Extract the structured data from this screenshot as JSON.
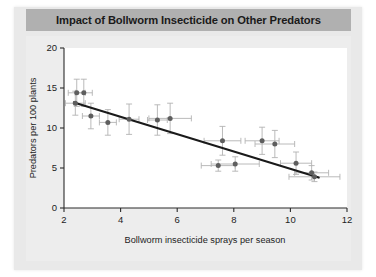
{
  "figure": {
    "title": "Impact of Bollworm Insecticide on Other Predators",
    "title_bg": "#b0b0b0",
    "panel_bg": "#e9e9e9",
    "plot_bg": "#ffffff"
  },
  "chart_data": {
    "type": "scatter",
    "title": "Impact of Bollworm Insecticide on Other Predators",
    "xlabel": "Bollworm insecticide sprays per season",
    "ylabel": "Predators per 100 plants",
    "xlim": [
      2,
      12
    ],
    "ylim": [
      0,
      20
    ],
    "xticks": [
      2,
      4,
      6,
      8,
      10,
      12
    ],
    "yticks": [
      0,
      5,
      10,
      15,
      20
    ],
    "xtick_labels": [
      "2",
      "4",
      "6",
      "8",
      "10",
      "12"
    ],
    "ytick_labels": [
      "0",
      "5",
      "10",
      "15",
      "20"
    ],
    "grid": false,
    "legend": null,
    "point_color": "#5e5e5e",
    "errorbar_color": "#b2b2b2",
    "trendline_color": "#1a1a1a",
    "points": [
      {
        "x": 2.45,
        "y": 14.4,
        "xerr": 0.3,
        "yerr": 1.7
      },
      {
        "x": 2.7,
        "y": 14.4,
        "xerr": 0.3,
        "yerr": 1.7
      },
      {
        "x": 2.4,
        "y": 13.1,
        "xerr": 0.35,
        "yerr": 1.5
      },
      {
        "x": 2.95,
        "y": 11.5,
        "xerr": 0.3,
        "yerr": 1.6
      },
      {
        "x": 3.55,
        "y": 10.7,
        "xerr": 0.3,
        "yerr": 1.6
      },
      {
        "x": 4.3,
        "y": 11.1,
        "xerr": 0.35,
        "yerr": 1.9
      },
      {
        "x": 5.3,
        "y": 11.0,
        "xerr": 0.35,
        "yerr": 1.9
      },
      {
        "x": 5.75,
        "y": 11.2,
        "xerr": 0.75,
        "yerr": 1.9
      },
      {
        "x": 7.6,
        "y": 8.4,
        "xerr": 0.65,
        "yerr": 1.8
      },
      {
        "x": 7.45,
        "y": 5.3,
        "xerr": 0.6,
        "yerr": 0.7
      },
      {
        "x": 8.05,
        "y": 5.5,
        "xerr": 0.85,
        "yerr": 0.9
      },
      {
        "x": 9.0,
        "y": 8.4,
        "xerr": 0.6,
        "yerr": 1.7
      },
      {
        "x": 9.45,
        "y": 8.0,
        "xerr": 0.7,
        "yerr": 1.7
      },
      {
        "x": 10.2,
        "y": 5.6,
        "xerr": 0.55,
        "yerr": 1.4
      },
      {
        "x": 10.75,
        "y": 4.4,
        "xerr": 0.6,
        "yerr": 0.9
      },
      {
        "x": 10.85,
        "y": 3.9,
        "xerr": 0.9,
        "yerr": 0.6
      }
    ],
    "trendline": {
      "x1": 2.35,
      "y1": 13.2,
      "x2": 11.0,
      "y2": 3.8
    }
  }
}
